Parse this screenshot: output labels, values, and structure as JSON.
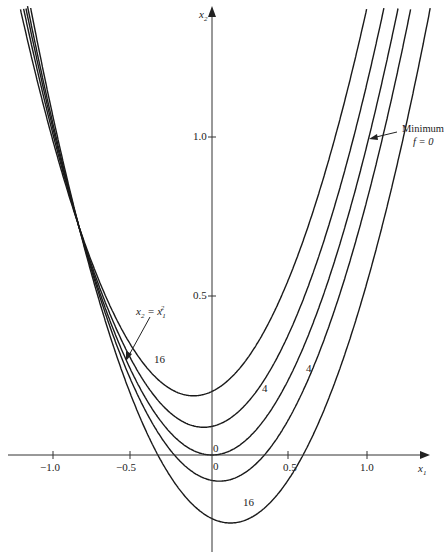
{
  "chart_data": {
    "type": "line",
    "title": "",
    "xlabel": "x1",
    "ylabel": "x2",
    "xlim": [
      -1.3,
      1.4
    ],
    "ylim": [
      -0.3,
      1.42
    ],
    "x_ticks": [
      -1.0,
      -0.5,
      0,
      0.5,
      1.0
    ],
    "x_tick_labels": [
      "−1.0",
      "−0.5",
      "0",
      "0.5",
      "1.0"
    ],
    "y_ticks": [
      0.5,
      1.0
    ],
    "y_tick_labels": [
      "0.5",
      "1.0"
    ],
    "grid": false,
    "legend": null,
    "series": [
      {
        "name": "contour f=16 (upper)",
        "level": 16,
        "x2_at_x1_0": 0.2
      },
      {
        "name": "contour f=4 (upper)",
        "level": 4,
        "x2_at_x1_0": 0.09
      },
      {
        "name": "contour f=0 / x2 = x1^2",
        "level": 0,
        "x2_at_x1_0": 0.0
      },
      {
        "name": "contour f=4 (lower)",
        "level": 4,
        "x2_at_x1_0": -0.08
      },
      {
        "name": "contour f=16 (lower)",
        "level": 16,
        "x2_at_x1_0": -0.2
      }
    ],
    "annotations": [
      {
        "text": "Minimum f = 0",
        "points_to": [
          1.0,
          1.0
        ]
      },
      {
        "text": "x2 = x1^2",
        "points_to": [
          -0.55,
          0.3
        ]
      },
      {
        "text": "16",
        "at": [
          -0.35,
          0.27
        ]
      },
      {
        "text": "4",
        "at": [
          0.15,
          0.15
        ]
      },
      {
        "text": "4",
        "at": [
          0.45,
          0.23
        ]
      },
      {
        "text": "0",
        "at": [
          0.02,
          0.03
        ]
      },
      {
        "text": "0",
        "at": [
          0.02,
          -0.04
        ]
      },
      {
        "text": "16",
        "at": [
          0.07,
          -0.21
        ]
      }
    ]
  },
  "labels": {
    "x1_axis": "x",
    "x1_sub": "1",
    "x2_axis": "x",
    "x2_sub": "2",
    "y_tick_1": "1.0",
    "y_tick_05": "0.5",
    "x_tick_m1": "−1.0",
    "x_tick_m05": "−0.5",
    "x_tick_0": "0",
    "x_tick_05": "0.5",
    "x_tick_1": "1.0",
    "minimum_line1": "Minimum",
    "minimum_line2": "f = 0",
    "parabola_lhs": "x",
    "parabola_eq": " = x",
    "c16a": "16",
    "c4a": "4",
    "c4b": "4",
    "c0a": "0",
    "c0b": "0",
    "c16b": "16"
  }
}
